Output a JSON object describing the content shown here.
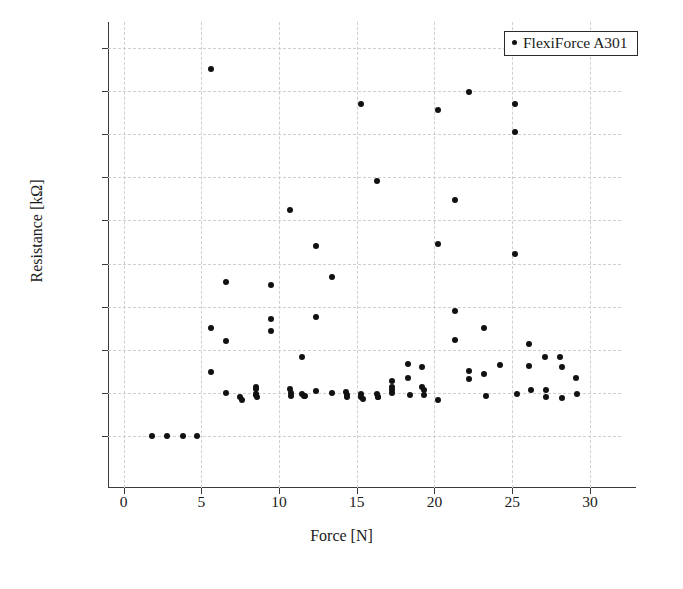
{
  "chart_data": {
    "type": "scatter",
    "title": "",
    "xlabel": "Force [N]",
    "ylabel": "Resistance [kΩ]",
    "xlim": [
      -1,
      32
    ],
    "ylim": [
      -1200,
      9600
    ],
    "xticks": [
      0,
      5,
      10,
      15,
      20,
      25,
      30
    ],
    "xticklabels": [
      "0",
      "5",
      "10",
      "15",
      "20",
      "25",
      "30"
    ],
    "yticks": [
      0,
      1000,
      2000,
      3000,
      4000,
      5000,
      6000,
      7000,
      8000,
      9000
    ],
    "yticklabels": [
      "0",
      "1,000",
      "2,000",
      "3,000",
      "4,000",
      "5,000",
      "6,000",
      "7,000",
      "8,000",
      "9,000"
    ],
    "grid": true,
    "grid_style": "dashed",
    "grid_color": "#cfcfcf",
    "marker_color": "#111111",
    "legend_position": "top-right",
    "legend": [
      "FlexiForce A301"
    ],
    "series": [
      {
        "name": "FlexiForce A301",
        "marker": "circle",
        "points": [
          [
            1.8,
            0
          ],
          [
            2.8,
            0
          ],
          [
            3.8,
            0
          ],
          [
            4.7,
            0
          ],
          [
            5.6,
            8500
          ],
          [
            5.6,
            2510
          ],
          [
            5.6,
            1500
          ],
          [
            6.6,
            3570
          ],
          [
            6.6,
            2210
          ],
          [
            6.6,
            1010
          ],
          [
            7.5,
            900
          ],
          [
            7.6,
            845
          ],
          [
            8.5,
            1150
          ],
          [
            8.5,
            1100
          ],
          [
            8.5,
            985
          ],
          [
            8.5,
            950
          ],
          [
            8.6,
            900
          ],
          [
            9.5,
            3510
          ],
          [
            9.5,
            2710
          ],
          [
            9.5,
            2450
          ],
          [
            10.7,
            5250
          ],
          [
            10.7,
            1090
          ],
          [
            10.8,
            1000
          ],
          [
            10.8,
            930
          ],
          [
            11.5,
            1830
          ],
          [
            11.5,
            985
          ],
          [
            11.6,
            940
          ],
          [
            11.7,
            930
          ],
          [
            12.4,
            4400
          ],
          [
            12.4,
            2760
          ],
          [
            12.4,
            1040
          ],
          [
            13.4,
            3700
          ],
          [
            13.4,
            1010
          ],
          [
            14.3,
            1030
          ],
          [
            14.4,
            960
          ],
          [
            14.4,
            915
          ],
          [
            15.3,
            7710
          ],
          [
            15.3,
            985
          ],
          [
            15.3,
            900
          ],
          [
            15.4,
            860
          ],
          [
            16.3,
            5920
          ],
          [
            16.3,
            975
          ],
          [
            16.4,
            920
          ],
          [
            16.4,
            900
          ],
          [
            17.3,
            1290
          ],
          [
            17.3,
            1130
          ],
          [
            17.3,
            1080
          ],
          [
            17.3,
            1010
          ],
          [
            18.3,
            1670
          ],
          [
            18.3,
            1340
          ],
          [
            18.4,
            960
          ],
          [
            19.2,
            1600
          ],
          [
            19.2,
            1140
          ],
          [
            19.3,
            1060
          ],
          [
            19.3,
            960
          ],
          [
            20.2,
            7570
          ],
          [
            20.2,
            4460
          ],
          [
            20.2,
            845
          ],
          [
            21.3,
            5470
          ],
          [
            21.3,
            2900
          ],
          [
            21.3,
            2240
          ],
          [
            22.2,
            7970
          ],
          [
            22.2,
            1510
          ],
          [
            22.2,
            1330
          ],
          [
            23.2,
            2510
          ],
          [
            23.2,
            1450
          ],
          [
            23.3,
            930
          ],
          [
            24.2,
            1650
          ],
          [
            25.2,
            7690
          ],
          [
            25.2,
            7040
          ],
          [
            25.2,
            4230
          ],
          [
            25.3,
            975
          ],
          [
            26.1,
            2140
          ],
          [
            26.1,
            1630
          ],
          [
            26.2,
            1070
          ],
          [
            27.1,
            1840
          ],
          [
            27.2,
            1070
          ],
          [
            27.2,
            920
          ],
          [
            28.1,
            1840
          ],
          [
            28.2,
            1610
          ],
          [
            28.2,
            880
          ],
          [
            29.1,
            1340
          ],
          [
            29.2,
            980
          ]
        ]
      }
    ]
  }
}
